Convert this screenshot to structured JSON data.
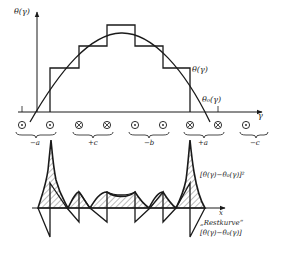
{
  "figure": {
    "top_plot": {
      "y_axis_label": "θ(γ)",
      "x_axis_label": "γ",
      "step_curve_label": "θ(γ)",
      "fundamental_curve_label": "θ₀(γ)"
    },
    "conductors": {
      "symbols": [
        "dot",
        "dot",
        "cross",
        "cross",
        "dot",
        "dot",
        "cross",
        "cross",
        "dot"
      ],
      "groups": [
        {
          "label": "−a"
        },
        {
          "label": "+c"
        },
        {
          "label": "−b"
        },
        {
          "label": "+a"
        },
        {
          "label": "−c"
        }
      ]
    },
    "bottom_plot": {
      "x_axis_label": "x",
      "squared_label": "[θ(γ)−θ₀(γ)]²",
      "residual_title": "„Restkurve“",
      "residual_label": "[θ(γ)−θ₀(γ)]"
    },
    "colors": {
      "line": "#1a1a1a",
      "hatch": "#555555",
      "background": "#ffffff"
    }
  }
}
